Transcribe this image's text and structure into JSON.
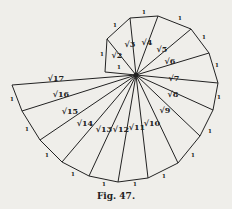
{
  "figure": {
    "caption": "Fig. 47.",
    "center": [
      136,
      75
    ],
    "stroke_color": "#222222",
    "background": "#efeeea",
    "outer_points": [
      [
        105,
        72
      ],
      [
        107,
        39
      ],
      [
        130,
        18
      ],
      [
        158,
        16
      ],
      [
        191,
        29
      ],
      [
        209,
        53
      ],
      [
        218,
        83
      ],
      [
        213,
        110
      ],
      [
        200,
        136
      ],
      [
        178,
        163
      ],
      [
        148,
        178
      ],
      [
        118,
        182
      ],
      [
        89,
        176
      ],
      [
        62,
        162
      ],
      [
        40,
        140
      ],
      [
        22,
        111
      ],
      [
        12,
        85
      ]
    ],
    "radius_labels": [
      {
        "text": "√2",
        "x": 117,
        "y": 58
      },
      {
        "text": "√3",
        "x": 130,
        "y": 47
      },
      {
        "text": "√4",
        "x": 147,
        "y": 45
      },
      {
        "text": "√5",
        "x": 162,
        "y": 52
      },
      {
        "text": "√6",
        "x": 170,
        "y": 64
      },
      {
        "text": "√7",
        "x": 174,
        "y": 81
      },
      {
        "text": "√8",
        "x": 173,
        "y": 97
      },
      {
        "text": "√9",
        "x": 165,
        "y": 113
      },
      {
        "text": "√10",
        "x": 152,
        "y": 126
      },
      {
        "text": "√11",
        "x": 137,
        "y": 130
      },
      {
        "text": "√12",
        "x": 121,
        "y": 132
      },
      {
        "text": "√13",
        "x": 104,
        "y": 132
      },
      {
        "text": "√14",
        "x": 85,
        "y": 126
      },
      {
        "text": "√15",
        "x": 70,
        "y": 114
      },
      {
        "text": "√16",
        "x": 61,
        "y": 97
      },
      {
        "text": "√17",
        "x": 56,
        "y": 81
      }
    ],
    "unit_labels": [
      {
        "text": "1",
        "x": 119,
        "y": 69
      },
      {
        "text": "1",
        "x": 102,
        "y": 56
      },
      {
        "text": "1",
        "x": 115,
        "y": 27
      },
      {
        "text": "1",
        "x": 144,
        "y": 14
      },
      {
        "text": "1",
        "x": 180,
        "y": 20
      },
      {
        "text": "1",
        "x": 204,
        "y": 39
      },
      {
        "text": "1",
        "x": 217,
        "y": 67
      },
      {
        "text": "1",
        "x": 219,
        "y": 99
      },
      {
        "text": "1",
        "x": 210,
        "y": 133
      },
      {
        "text": "1",
        "x": 193,
        "y": 157
      },
      {
        "text": "1",
        "x": 164,
        "y": 178
      },
      {
        "text": "1",
        "x": 135,
        "y": 186
      },
      {
        "text": "1",
        "x": 104,
        "y": 186
      },
      {
        "text": "1",
        "x": 73,
        "y": 176
      },
      {
        "text": "1",
        "x": 47,
        "y": 157
      },
      {
        "text": "1",
        "x": 27,
        "y": 131
      },
      {
        "text": "1",
        "x": 12,
        "y": 101
      }
    ]
  }
}
